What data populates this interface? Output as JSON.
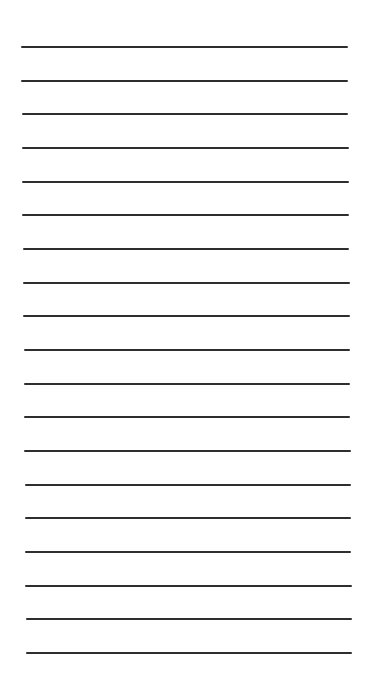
{
  "page": {
    "type": "lined-paper",
    "line_color": "#2e2e2e",
    "line_count": 19,
    "first_line_y": 47,
    "last_line_y": 653,
    "left_start_x": 21,
    "left_end_x": 26,
    "right_start_x": 348,
    "right_end_x": 352,
    "line_thickness": 2
  }
}
